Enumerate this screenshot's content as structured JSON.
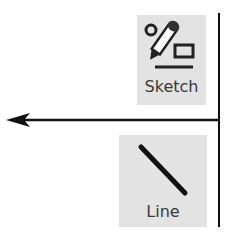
{
  "toolbar": {
    "sketch": {
      "label": "Sketch",
      "icon": "pencil-sketch-icon"
    },
    "line": {
      "label": "Line",
      "icon": "diagonal-line-icon"
    }
  },
  "diagram": {
    "arrow_direction": "left",
    "colors": {
      "button_bg": "#e3e3e3",
      "stroke": "#111111",
      "label": "#3a3a3a"
    }
  }
}
